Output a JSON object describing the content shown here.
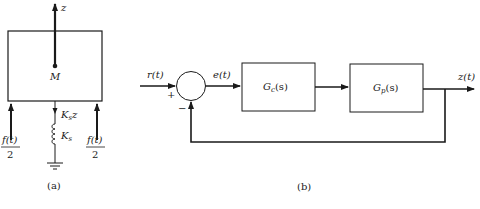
{
  "figure_a": {
    "caption": "(a)",
    "mass_label": "M",
    "axis_label": "z",
    "spring_force_label": "K",
    "spring_force_sub": "s",
    "spring_force_suffix": "z",
    "spring_const_label": "K",
    "spring_const_sub": "s",
    "force_left": {
      "numerator": "f(t)",
      "denominator": "2"
    },
    "force_right": {
      "numerator": "f(t)",
      "denominator": "2"
    }
  },
  "figure_b": {
    "caption": "(b)",
    "input_label": "r(t)",
    "error_label": "e(t)",
    "output_label": "z(t)",
    "plus_sign": "+",
    "minus_sign": "−",
    "controller": {
      "name": "G",
      "sub": "c",
      "arg": "(s)"
    },
    "plant": {
      "name": "G",
      "sub": "p",
      "arg": "(s)"
    }
  },
  "colors": {
    "stroke": "#1a1a1a",
    "background": "#ffffff"
  }
}
